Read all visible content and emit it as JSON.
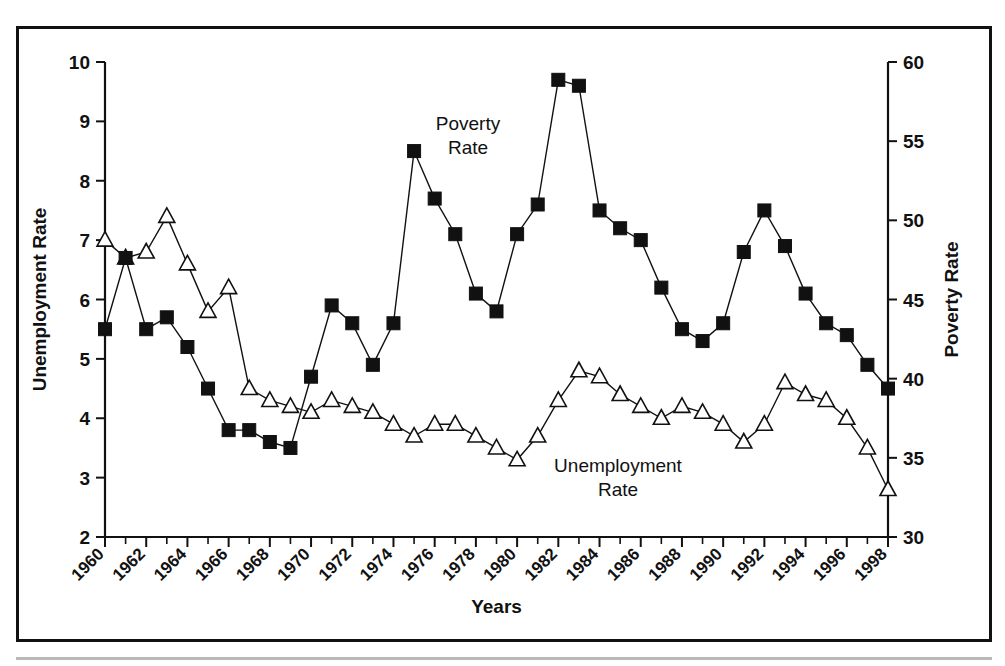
{
  "figure": {
    "background_color": "#ffffff",
    "frame_color": "#111111",
    "ink_color": "#111111"
  },
  "chart_data": {
    "type": "line",
    "title": "",
    "subtitle": "",
    "xlabel": "Years",
    "ylabel": "Unemployment Rate",
    "y2label": "Poverty Rate",
    "grid": false,
    "legend_position": "inline-annotations",
    "annotations": [
      {
        "text": "Poverty",
        "text2": "Rate",
        "target_series": "Poverty Rate"
      },
      {
        "text": "Unemployment",
        "text2": "Rate",
        "target_series": "Unemployment Rate"
      }
    ],
    "x": [
      1960,
      1961,
      1962,
      1963,
      1964,
      1965,
      1966,
      1967,
      1968,
      1969,
      1970,
      1971,
      1972,
      1973,
      1974,
      1975,
      1976,
      1977,
      1978,
      1979,
      1980,
      1981,
      1982,
      1983,
      1984,
      1985,
      1986,
      1987,
      1988,
      1989,
      1990,
      1991,
      1992,
      1993,
      1994,
      1995,
      1996,
      1997,
      1998
    ],
    "xlim": [
      1960,
      1998
    ],
    "xtick_labels": [
      "1960",
      "1962",
      "1964",
      "1966",
      "1968",
      "1970",
      "1972",
      "1974",
      "1976",
      "1978",
      "1980",
      "1982",
      "1984",
      "1986",
      "1988",
      "1990",
      "1992",
      "1994",
      "1996",
      "1998"
    ],
    "xtick_step": 2,
    "xtick_minor_step": 1,
    "ylim": [
      2,
      10
    ],
    "ytick_labels": [
      "2",
      "3",
      "4",
      "5",
      "6",
      "7",
      "8",
      "9",
      "10"
    ],
    "y2lim": [
      30,
      60
    ],
    "y2tick_labels": [
      "30",
      "35",
      "40",
      "45",
      "50",
      "55",
      "60"
    ],
    "series": [
      {
        "name": "Unemployment Rate",
        "axis": "left",
        "marker": "open-triangle",
        "values": [
          7.0,
          6.7,
          6.8,
          7.4,
          6.6,
          5.8,
          6.2,
          4.5,
          4.3,
          4.2,
          4.1,
          4.3,
          4.2,
          4.1,
          3.9,
          3.7,
          3.9,
          3.9,
          3.7,
          3.5,
          3.3,
          3.7,
          4.3,
          4.8,
          4.7,
          4.4,
          4.2,
          4.0,
          4.2,
          4.1,
          3.9,
          3.6,
          3.9,
          4.6,
          4.4,
          4.3,
          4.0,
          3.5,
          2.8
        ]
      },
      {
        "name": "Poverty Rate",
        "axis": "right",
        "marker": "filled-square",
        "values": [
          5.5,
          6.7,
          5.5,
          5.7,
          5.2,
          4.5,
          3.8,
          3.8,
          3.6,
          3.5,
          4.7,
          5.9,
          5.6,
          4.9,
          5.6,
          8.5,
          7.7,
          7.1,
          6.1,
          5.8,
          7.1,
          7.6,
          9.7,
          9.6,
          7.5,
          7.2,
          7.0,
          6.2,
          5.5,
          5.3,
          5.6,
          6.8,
          7.5,
          6.9,
          6.1,
          5.6,
          5.4,
          4.9,
          4.5
        ]
      }
    ]
  }
}
